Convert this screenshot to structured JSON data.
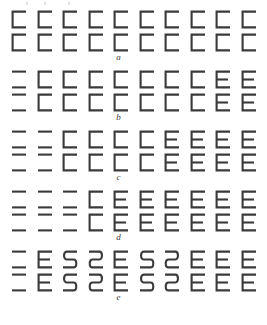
{
  "figure": {
    "title_visible": false,
    "background_color": "#ffffff",
    "stroke_color": "#3a3a3a",
    "columns": 10,
    "lines_per_row": 2,
    "row_labels": [
      "a",
      "b",
      "c",
      "d",
      "e"
    ],
    "clipped_caption_above": true
  },
  "chart_data": {
    "type": "table",
    "title": "",
    "xlabel": "",
    "ylabel": "",
    "legend": [],
    "glyph_types": {
      "equals": "two horizontal bars, no vertical stem",
      "c": "square C: top bar, left stem, bottom bar",
      "e": "square E: top bar, left stem, middle bar, bottom bar",
      "s": "rounded S / 5 shape",
      "s_mirrored": "mirrored rounded S shape"
    },
    "categories": [
      "1",
      "2",
      "3",
      "4",
      "5",
      "6",
      "7",
      "8",
      "9",
      "10"
    ],
    "rows": [
      {
        "label": "a",
        "line1": [
          "c",
          "c",
          "c",
          "c",
          "c",
          "c",
          "c",
          "c",
          "c",
          "c"
        ],
        "line2": [
          "c",
          "c",
          "c",
          "c",
          "c",
          "c",
          "c",
          "c",
          "c",
          "c"
        ]
      },
      {
        "label": "b",
        "line1": [
          "equals",
          "c",
          "c",
          "c",
          "c",
          "c",
          "c",
          "c",
          "e",
          "e"
        ],
        "line2": [
          "equals",
          "c",
          "c",
          "c",
          "c",
          "c",
          "c",
          "c",
          "e",
          "e"
        ]
      },
      {
        "label": "c",
        "line1": [
          "equals",
          "equals",
          "c",
          "c",
          "c",
          "c",
          "e",
          "e",
          "e",
          "e"
        ],
        "line2": [
          "equals",
          "equals",
          "c",
          "c",
          "c",
          "c",
          "e",
          "e",
          "e",
          "e"
        ]
      },
      {
        "label": "d",
        "line1": [
          "equals",
          "equals",
          "equals",
          "c",
          "e",
          "e",
          "e",
          "e",
          "e",
          "e"
        ],
        "line2": [
          "equals",
          "equals",
          "equals",
          "c",
          "e",
          "e",
          "e",
          "e",
          "e",
          "e"
        ]
      },
      {
        "label": "e",
        "line1": [
          "equals",
          "e",
          "s",
          "s_mirrored",
          "e",
          "s",
          "s_mirrored",
          "e",
          "e",
          "e"
        ],
        "line2": [
          "equals",
          "e",
          "s",
          "s_mirrored",
          "e",
          "s",
          "s_mirrored",
          "e",
          "e",
          "e"
        ]
      }
    ]
  }
}
